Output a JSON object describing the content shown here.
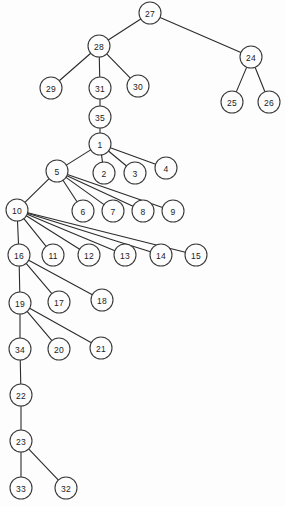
{
  "diagram": {
    "type": "tree-graph",
    "canvas": {
      "width": 285,
      "height": 506
    },
    "style": {
      "background_color": "#fdfdfd",
      "node_fill": "#fdfdfd",
      "node_stroke": "#3a3a3a",
      "edge_stroke": "#2b2b2b",
      "label_color": "#1b1b1b",
      "node_radius": 11
    },
    "root": "27",
    "nodes": [
      {
        "id": "n27",
        "label": "27",
        "x": 150,
        "y": 13
      },
      {
        "id": "n28",
        "label": "28",
        "x": 99,
        "y": 46
      },
      {
        "id": "n24",
        "label": "24",
        "x": 251,
        "y": 57
      },
      {
        "id": "n29",
        "label": "29",
        "x": 51,
        "y": 88
      },
      {
        "id": "n31",
        "label": "31",
        "x": 100,
        "y": 88
      },
      {
        "id": "n30",
        "label": "30",
        "x": 138,
        "y": 86
      },
      {
        "id": "n25",
        "label": "25",
        "x": 232,
        "y": 102
      },
      {
        "id": "n26",
        "label": "26",
        "x": 269,
        "y": 102
      },
      {
        "id": "n35",
        "label": "35",
        "x": 100,
        "y": 117
      },
      {
        "id": "n1",
        "label": "1",
        "x": 100,
        "y": 144
      },
      {
        "id": "n5",
        "label": "5",
        "x": 57,
        "y": 171
      },
      {
        "id": "n2",
        "label": "2",
        "x": 104,
        "y": 173
      },
      {
        "id": "n3",
        "label": "3",
        "x": 135,
        "y": 173
      },
      {
        "id": "n4",
        "label": "4",
        "x": 166,
        "y": 168
      },
      {
        "id": "n10",
        "label": "10",
        "x": 17,
        "y": 210
      },
      {
        "id": "n6",
        "label": "6",
        "x": 83,
        "y": 211
      },
      {
        "id": "n7",
        "label": "7",
        "x": 113,
        "y": 211
      },
      {
        "id": "n8",
        "label": "8",
        "x": 143,
        "y": 211
      },
      {
        "id": "n9",
        "label": "9",
        "x": 173,
        "y": 211
      },
      {
        "id": "n16",
        "label": "16",
        "x": 19,
        "y": 255
      },
      {
        "id": "n11",
        "label": "11",
        "x": 53,
        "y": 255
      },
      {
        "id": "n12",
        "label": "12",
        "x": 89,
        "y": 255
      },
      {
        "id": "n13",
        "label": "13",
        "x": 125,
        "y": 255
      },
      {
        "id": "n14",
        "label": "14",
        "x": 161,
        "y": 255
      },
      {
        "id": "n15",
        "label": "15",
        "x": 196,
        "y": 255
      },
      {
        "id": "n19",
        "label": "19",
        "x": 20,
        "y": 303
      },
      {
        "id": "n17",
        "label": "17",
        "x": 59,
        "y": 302
      },
      {
        "id": "n18",
        "label": "18",
        "x": 102,
        "y": 300
      },
      {
        "id": "n34",
        "label": "34",
        "x": 20,
        "y": 349
      },
      {
        "id": "n20",
        "label": "20",
        "x": 59,
        "y": 349
      },
      {
        "id": "n21",
        "label": "21",
        "x": 101,
        "y": 348
      },
      {
        "id": "n22",
        "label": "22",
        "x": 21,
        "y": 395
      },
      {
        "id": "n23",
        "label": "23",
        "x": 21,
        "y": 441
      },
      {
        "id": "n33",
        "label": "33",
        "x": 21,
        "y": 488
      },
      {
        "id": "n32",
        "label": "32",
        "x": 66,
        "y": 488
      }
    ],
    "edges": [
      {
        "from": "n27",
        "to": "n28"
      },
      {
        "from": "n27",
        "to": "n24"
      },
      {
        "from": "n28",
        "to": "n29"
      },
      {
        "from": "n28",
        "to": "n31"
      },
      {
        "from": "n28",
        "to": "n30"
      },
      {
        "from": "n24",
        "to": "n25"
      },
      {
        "from": "n24",
        "to": "n26"
      },
      {
        "from": "n31",
        "to": "n35"
      },
      {
        "from": "n35",
        "to": "n1"
      },
      {
        "from": "n1",
        "to": "n5"
      },
      {
        "from": "n1",
        "to": "n2"
      },
      {
        "from": "n1",
        "to": "n3"
      },
      {
        "from": "n1",
        "to": "n4"
      },
      {
        "from": "n5",
        "to": "n10"
      },
      {
        "from": "n5",
        "to": "n6"
      },
      {
        "from": "n5",
        "to": "n7"
      },
      {
        "from": "n5",
        "to": "n8"
      },
      {
        "from": "n5",
        "to": "n9"
      },
      {
        "from": "n10",
        "to": "n16"
      },
      {
        "from": "n10",
        "to": "n11"
      },
      {
        "from": "n10",
        "to": "n12"
      },
      {
        "from": "n10",
        "to": "n13"
      },
      {
        "from": "n10",
        "to": "n14"
      },
      {
        "from": "n10",
        "to": "n15"
      },
      {
        "from": "n16",
        "to": "n19"
      },
      {
        "from": "n16",
        "to": "n17"
      },
      {
        "from": "n16",
        "to": "n18"
      },
      {
        "from": "n19",
        "to": "n34"
      },
      {
        "from": "n19",
        "to": "n20"
      },
      {
        "from": "n19",
        "to": "n21"
      },
      {
        "from": "n34",
        "to": "n22"
      },
      {
        "from": "n22",
        "to": "n23"
      },
      {
        "from": "n23",
        "to": "n33"
      },
      {
        "from": "n23",
        "to": "n32"
      }
    ]
  }
}
